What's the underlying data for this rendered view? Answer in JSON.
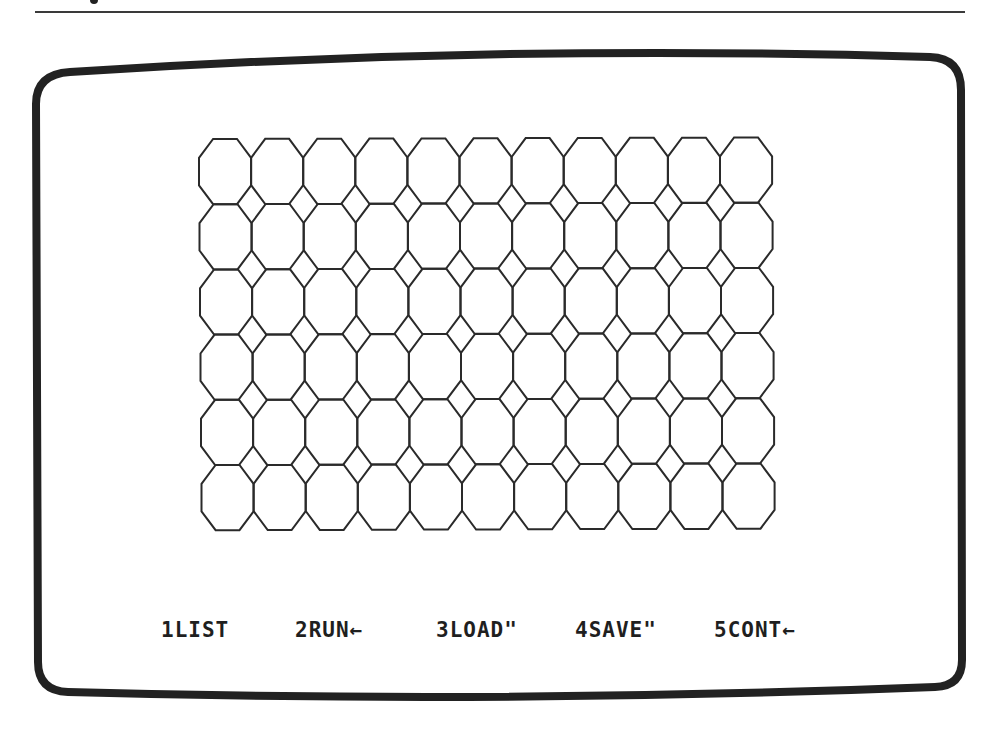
{
  "page": {
    "rule_color": "#3a3a3a"
  },
  "screen": {
    "frame_color": "#222222",
    "background": "#ffffff",
    "frame": {
      "top_left": [
        38,
        72
      ],
      "top_right": [
        961,
        57
      ],
      "bottom_right": [
        961,
        685
      ],
      "bottom_left": [
        38,
        692
      ]
    }
  },
  "graphics": {
    "pattern": "octagon-tiling",
    "columns": 11,
    "rows": 6,
    "origin": [
      199,
      139
    ],
    "cell_width": 52.1,
    "cell_height": 65.2,
    "skew_per_row": 0.5,
    "stroke_color": "#2a2a2a"
  },
  "function_keys": [
    {
      "key": "1",
      "label": "1LIST",
      "x": 161
    },
    {
      "key": "2",
      "label": "2RUN←",
      "x": 295
    },
    {
      "key": "3",
      "label": "3LOAD\"",
      "x": 436
    },
    {
      "key": "4",
      "label": "4SAVE\"",
      "x": 575
    },
    {
      "key": "5",
      "label": "5CONT←",
      "x": 714
    }
  ]
}
